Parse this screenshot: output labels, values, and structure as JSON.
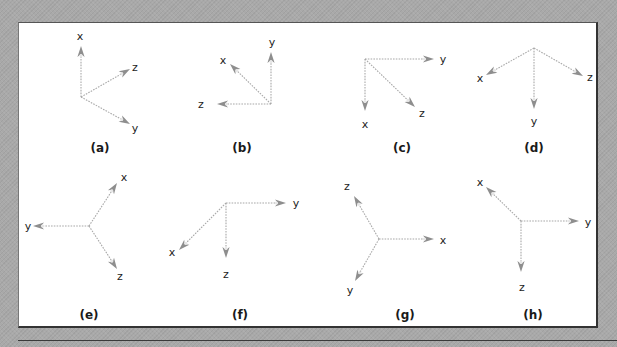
{
  "figure": {
    "colors": {
      "background": "#a9a9a9",
      "panel": "#ffffff",
      "axis_line": "#a8a8a8",
      "arrow_head": "#8e8e8e",
      "text": "#222222"
    },
    "diagrams": [
      {
        "caption": "(a)",
        "caption_pos": [
          100,
          152
        ],
        "origin": [
          81,
          97
        ],
        "axes": [
          {
            "name": "x",
            "tip": [
              81,
              46
            ],
            "label_pos": [
              80,
              40
            ]
          },
          {
            "name": "z",
            "tip": [
              130,
              69
            ],
            "label_pos": [
              135,
              71
            ]
          },
          {
            "name": "y",
            "tip": [
              130,
              124
            ],
            "label_pos": [
              135,
              132
            ]
          }
        ]
      },
      {
        "caption": "(b)",
        "caption_pos": [
          242,
          152
        ],
        "origin": [
          271,
          104
        ],
        "axes": [
          {
            "name": "y",
            "tip": [
              271,
              52
            ],
            "label_pos": [
              272,
              46
            ]
          },
          {
            "name": "x",
            "tip": [
              230,
              64
            ],
            "label_pos": [
              223,
              64
            ]
          },
          {
            "name": "z",
            "tip": [
              217,
              104
            ],
            "label_pos": [
              201,
              108
            ]
          }
        ]
      },
      {
        "caption": "(c)",
        "caption_pos": [
          402,
          152
        ],
        "origin": [
          365,
          59
        ],
        "axes": [
          {
            "name": "y",
            "tip": [
              434,
              59
            ],
            "label_pos": [
              443,
              63
            ]
          },
          {
            "name": "z",
            "tip": [
              415,
              107
            ],
            "label_pos": [
              422,
              117
            ]
          },
          {
            "name": "x",
            "tip": [
              365,
              111
            ],
            "label_pos": [
              365,
              128
            ]
          }
        ]
      },
      {
        "caption": "(d)",
        "caption_pos": [
          534,
          152
        ],
        "origin": [
          534,
          48
        ],
        "axes": [
          {
            "name": "x",
            "tip": [
              486,
              75
            ],
            "label_pos": [
              480,
              82
            ]
          },
          {
            "name": "z",
            "tip": [
              583,
              76
            ],
            "label_pos": [
              590,
              81
            ]
          },
          {
            "name": "y",
            "tip": [
              534,
              109
            ],
            "label_pos": [
              534,
              125
            ]
          }
        ]
      },
      {
        "caption": "(e)",
        "caption_pos": [
          89,
          319
        ],
        "origin": [
          89,
          226
        ],
        "axes": [
          {
            "name": "x",
            "tip": [
              117,
              183
            ],
            "label_pos": [
              124,
              181
            ]
          },
          {
            "name": "y",
            "tip": [
              33,
              226
            ],
            "label_pos": [
              28,
              230
            ]
          },
          {
            "name": "z",
            "tip": [
              117,
              269
            ],
            "label_pos": [
              120,
              280
            ]
          }
        ]
      },
      {
        "caption": "(f)",
        "caption_pos": [
          240,
          319
        ],
        "origin": [
          226,
          203
        ],
        "axes": [
          {
            "name": "y",
            "tip": [
              286,
              203
            ],
            "label_pos": [
              296,
              207
            ]
          },
          {
            "name": "x",
            "tip": [
              179,
              250
            ],
            "label_pos": [
              172,
              256
            ]
          },
          {
            "name": "z",
            "tip": [
              226,
              258
            ],
            "label_pos": [
              226,
              278
            ]
          }
        ]
      },
      {
        "caption": "(g)",
        "caption_pos": [
          405,
          319
        ],
        "origin": [
          379,
          239
        ],
        "axes": [
          {
            "name": "z",
            "tip": [
              354,
              196
            ],
            "label_pos": [
              347,
              190
            ]
          },
          {
            "name": "x",
            "tip": [
              434,
              239
            ],
            "label_pos": [
              443,
              244
            ]
          },
          {
            "name": "y",
            "tip": [
              355,
              281
            ],
            "label_pos": [
              350,
              294
            ]
          }
        ]
      },
      {
        "caption": "(h)",
        "caption_pos": [
          533,
          319
        ],
        "origin": [
          521,
          221
        ],
        "axes": [
          {
            "name": "x",
            "tip": [
              486,
              187
            ],
            "label_pos": [
              480,
              186
            ]
          },
          {
            "name": "y",
            "tip": [
              579,
              221
            ],
            "label_pos": [
              588,
              226
            ]
          },
          {
            "name": "z",
            "tip": [
              521,
              272
            ],
            "label_pos": [
              522,
              291
            ]
          }
        ]
      }
    ]
  }
}
